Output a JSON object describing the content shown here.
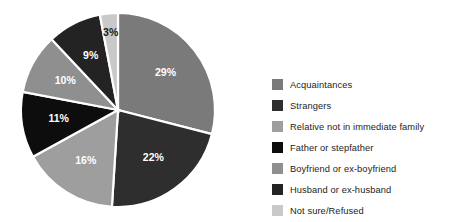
{
  "chart_data": {
    "type": "pie",
    "title": "",
    "subtitle": "",
    "xlabel": "",
    "ylabel": "",
    "legend_position": "right",
    "grid": false,
    "start_angle_deg": 0,
    "direction": "clockwise",
    "value_suffix": "%",
    "categories": [
      "Acquaintances",
      "Strangers",
      "Relative not in immediate family",
      "Father or stepfather",
      "Boyfriend or ex-boyfriend",
      "Husband or ex-husband",
      "Not sure/Refused"
    ],
    "values": [
      29,
      22,
      16,
      11,
      10,
      9,
      3
    ],
    "data_labels": [
      "29%",
      "22%",
      "16%",
      "11%",
      "10%",
      "9%",
      "3%"
    ],
    "colors": [
      "#7a7a7a",
      "#2e2e2e",
      "#9e9e9e",
      "#0d0d0d",
      "#8f8f8f",
      "#232323",
      "#c9c9c9"
    ],
    "label_colors": [
      "#ffffff",
      "#ffffff",
      "#ffffff",
      "#ffffff",
      "#ffffff",
      "#ffffff",
      "#1a1a1a"
    ],
    "slice_separator_color": "#ffffff",
    "background_color": "#ffffff"
  },
  "legend": {
    "items": [
      {
        "label": "Acquaintances",
        "color": "#7a7a7a"
      },
      {
        "label": "Strangers",
        "color": "#2e2e2e"
      },
      {
        "label": "Relative not in immediate family",
        "color": "#9e9e9e"
      },
      {
        "label": "Father or stepfather",
        "color": "#0d0d0d"
      },
      {
        "label": "Boyfriend or ex-boyfriend",
        "color": "#8f8f8f"
      },
      {
        "label": "Husband or ex-husband",
        "color": "#232323"
      },
      {
        "label": "Not sure/Refused",
        "color": "#c9c9c9"
      }
    ]
  },
  "geometry": {
    "center_x": 118,
    "center_y": 110,
    "radius": 97,
    "label_radius_factor": 0.62
  }
}
